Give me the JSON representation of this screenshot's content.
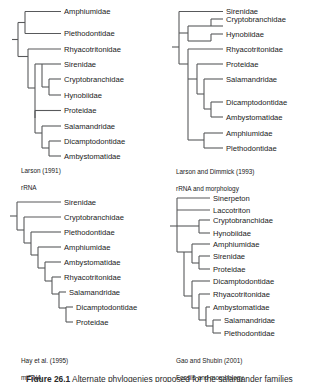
{
  "figure": {
    "caption_number": "Figure 26.1",
    "caption_text": "Alternate phylogenies proposed for the salamander families"
  },
  "panels": [
    {
      "id": "larson-1991",
      "position": "top-left",
      "source": "Larson (1991)",
      "data_type": "rRNA",
      "tips": [
        "Amphiumidae",
        "Plethodontidae",
        "Rhyacotritonidae",
        "Sirenidae",
        "Cryptobranchidae",
        "Hynobiidae",
        "Proteidae",
        "Salamandridae",
        "Dicamptodontidae",
        "Ambystomatidae"
      ]
    },
    {
      "id": "larson-dimmick-1993",
      "position": "top-right",
      "source": "Larson and Dimmick (1993)",
      "data_type": "rRNA and morphology",
      "tips": [
        "Sirenidae",
        "Cryptobranchidae",
        "Hynobiidae",
        "Rhyacotritonidae",
        "Proteidae",
        "Salamandridae",
        "Dicamptodontidae",
        "Ambystomatidae",
        "Amphiumidae",
        "Plethodontidae"
      ]
    },
    {
      "id": "hay-1995",
      "position": "bottom-left",
      "source": "Hay et al. (1995)",
      "data_type": "mtDNA",
      "tips": [
        "Sirenidae",
        "Cryptobranchidae",
        "Plethodontidae",
        "Amphiumidae",
        "Ambystomatidae",
        "Rhyacotritonidae",
        "Salamandridae",
        "Dicamptodontidae",
        "Proteidae"
      ]
    },
    {
      "id": "gao-shubin-2001",
      "position": "bottom-right",
      "source": "Gao and Shubin (2001)",
      "data_type": "Fossils and morphology",
      "tips": [
        "Sinerpeton",
        "Laccotriton",
        "Cryptobranchidae",
        "Hynobiidae",
        "Amphiumidae",
        "Sirenidae",
        "Proteidae",
        "Dicamptodontidae",
        "Rhyacotritonidae",
        "Ambystomatidae",
        "Salamandridae",
        "Plethodontidae"
      ]
    }
  ],
  "colors": {
    "branch_stroke": "#58595b",
    "label_text": "#1a1a1a",
    "background": "#ffffff"
  }
}
